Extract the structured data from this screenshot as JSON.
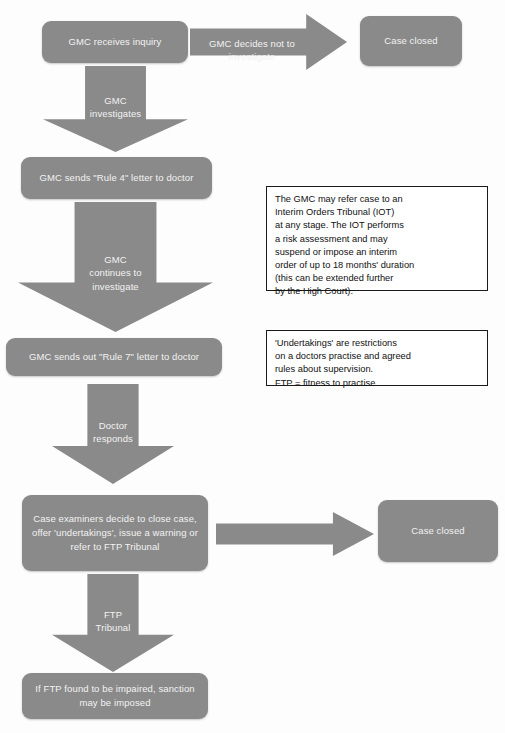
{
  "diagram": {
    "colors": {
      "node_fill": "#8a8a8a",
      "node_text": "#f2f2f2",
      "note_border": "#1a1a1a",
      "note_text": "#111111",
      "background": "#fdfdfd"
    }
  },
  "nodes": {
    "receives_inquiry": "GMC receives inquiry",
    "case_closed_top": "Case closed",
    "rule4_letter": "GMC sends \"Rule 4\" letter to doctor",
    "rule7_letter": "GMC sends out \"Rule 7\" letter to doctor",
    "case_examiners": "Case examiners decide to close case, offer 'undertakings', issue a warning or refer to FTP Tribunal",
    "case_closed_bottom": "Case closed",
    "sanction": "If FTP found to be impaired, sanction may be imposed"
  },
  "arrows": {
    "decides_not_to_investigate": "GMC decides not to investigate",
    "gmc_investigates": "GMC\ninvestigates",
    "gmc_continues": "GMC\ncontinues to\ninvestigate",
    "doctor_responds": "Doctor\nresponds",
    "ftp_tribunal": "FTP\nTribunal",
    "to_case_closed": ""
  },
  "notes": {
    "iot_note": "The GMC may refer case to an\nInterim Orders Tribunal (IOT)\nat any stage. The IOT performs\na risk assessment and may\nsuspend or impose an interim\norder of up to 18 months' duration\n(this can be extended further\nby the High Court).",
    "undertakings_note": "'Undertakings' are restrictions\non a doctors practise and agreed\nrules about supervision.\nFTP = fitness to practise"
  }
}
